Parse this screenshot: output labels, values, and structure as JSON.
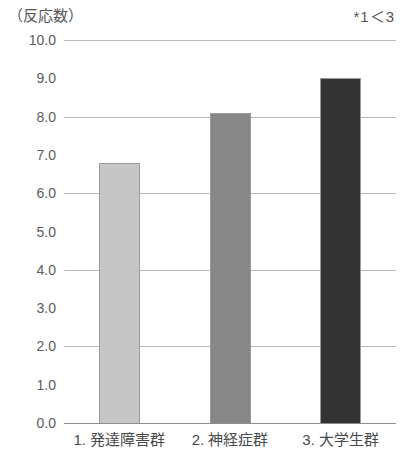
{
  "chart_data": {
    "type": "bar",
    "title": "（反応数）",
    "annotation": "*1＜3",
    "xlabel": "",
    "ylabel": "（反応数）",
    "categories": [
      "1. 発達障害群",
      "2. 神経症群",
      "3. 大学生群"
    ],
    "values": [
      6.8,
      8.1,
      9.0
    ],
    "series": [
      {
        "name": "反応数",
        "values": [
          6.8,
          8.1,
          9.0
        ]
      }
    ],
    "ylim": [
      0.0,
      10.0
    ],
    "ytick_step": 1.0,
    "ytick_labels": [
      "0.0",
      "1.0",
      "2.0",
      "3.0",
      "4.0",
      "5.0",
      "6.0",
      "7.0",
      "8.0",
      "9.0",
      "10.0"
    ],
    "gridlines_at": [
      0.0,
      2.0,
      4.0,
      6.0,
      8.0,
      10.0
    ],
    "grid": true,
    "legend": false,
    "legend_position": "none",
    "bar_colors": [
      "#c6c6c6",
      "#878787",
      "#333333"
    ],
    "bar_border_color": "#9a9a9a",
    "gridline_color": "#b9b9b9",
    "baseline_color": "#8d8d8d",
    "text_color": "#4a4a4a"
  }
}
